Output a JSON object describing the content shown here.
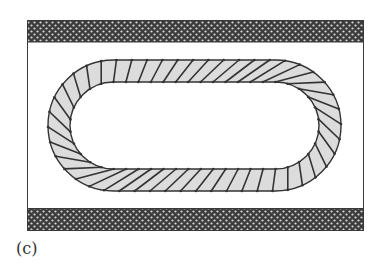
{
  "figure": {
    "label": "(c)",
    "frame": {
      "x": 27,
      "y": 20,
      "width": 337,
      "height": 211
    },
    "top_band": {
      "x": 27,
      "y": 20,
      "width": 337,
      "height": 22
    },
    "bottom_band": {
      "x": 27,
      "y": 209,
      "width": 337,
      "height": 22
    },
    "ring": {
      "outer": {
        "x": 48,
        "y": 60,
        "width": 293,
        "height": 131,
        "radius": 65
      },
      "inner": {
        "x": 70,
        "y": 82,
        "width": 249,
        "height": 87,
        "radius": 43
      },
      "segment_count": 48
    },
    "colors": {
      "frame_stroke": "#3a3a3a",
      "band_dark": "#3c3c3c",
      "band_dot": "#d8d8d8",
      "ring_fill": "#dcdcdc",
      "ring_stroke": "#333333",
      "background": "#ffffff"
    }
  }
}
